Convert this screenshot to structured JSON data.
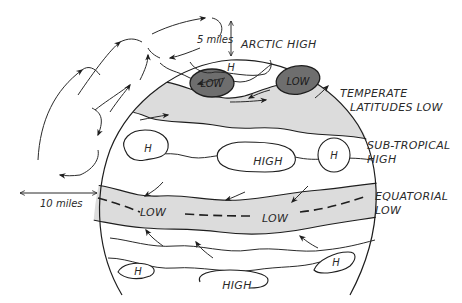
{
  "diagram": {
    "title": "",
    "colors": {
      "background": "#ffffff",
      "ink": "#1e1e1e",
      "shaded_band": "#dcdcdc",
      "low_cell": "#6e6e6e"
    },
    "scale_labels": {
      "vertical": "5 miles",
      "horizontal": "10 miles"
    },
    "zone_labels": {
      "arctic_high": "ARCTIC HIGH",
      "temperate_line1": "TEMPERATE",
      "temperate_line2": "LATITUDES LOW",
      "subtropical_line1": "SUB-TROPICAL",
      "subtropical_line2": "HIGH",
      "equatorial_line1": "EQUATORIAL",
      "equatorial_line2": "LOW"
    },
    "cell_labels": {
      "arctic_h": "H",
      "temperate_low_left": "LOW",
      "temperate_low_right": "LOW",
      "subtropical_h_left": "H",
      "subtropical_high_center": "HIGH",
      "subtropical_h_right": "H",
      "equatorial_low_left": "LOW",
      "equatorial_low_right": "LOW",
      "southern_h_left": "H",
      "southern_high_center": "HIGH",
      "southern_h_right": "H"
    },
    "icons": {
      "flow_arrow": "arrow",
      "scale_arrow": "double-headed-arrow"
    }
  }
}
